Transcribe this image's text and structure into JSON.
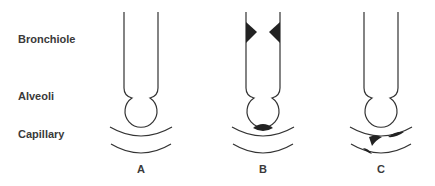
{
  "row_labels": {
    "bronchiole": "Bronchiole",
    "alveoli": "Alveoli",
    "capillary": "Capillary"
  },
  "panels": [
    {
      "label": "A",
      "description": "normal airway, alveolus and capillary"
    },
    {
      "label": "B",
      "description": "bronchiole narrowed by wall thickening; fluid/exudate in alveolus"
    },
    {
      "label": "C",
      "description": "capillary partially obstructed by emboli"
    }
  ],
  "colors": {
    "line": "#333333",
    "fill": "#222222",
    "text": "#3a3a3a"
  }
}
